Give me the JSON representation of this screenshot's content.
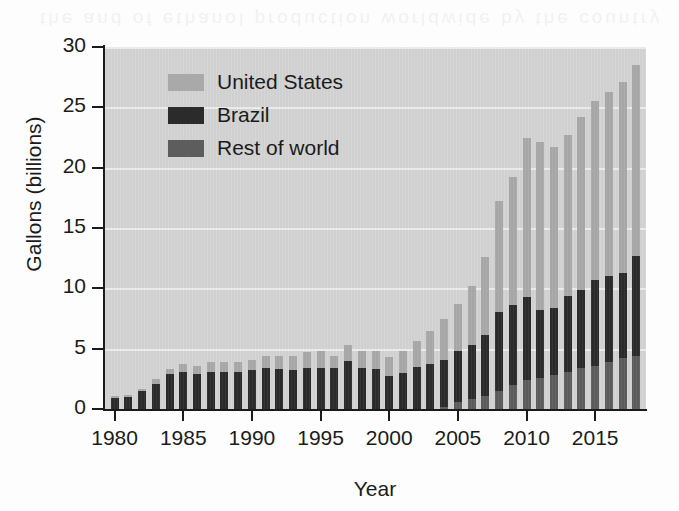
{
  "bleed_text": "the and of ethanol production worldwide by the country",
  "chart_data": {
    "type": "bar",
    "subtype": "stacked-bar",
    "title": "",
    "xlabel": "Year",
    "ylabel": "Gallons (billions)",
    "ylim": [
      0,
      30
    ],
    "yticks": [
      0,
      5,
      10,
      15,
      20,
      25,
      30
    ],
    "ytick_labels": [
      "0",
      "5",
      "10",
      "15",
      "20",
      "25",
      "30"
    ],
    "xticks": [
      1980,
      1985,
      1990,
      1995,
      2000,
      2005,
      2010,
      2015
    ],
    "xtick_labels": [
      "1980",
      "1985",
      "1990",
      "1995",
      "2000",
      "2005",
      "2010",
      "2015"
    ],
    "xlim": [
      1979.3,
      2018.7
    ],
    "grid": "horizontal",
    "legend_position": "top-left-inside",
    "stack_order_bottom_to_top": [
      "Rest of world",
      "Brazil",
      "United States"
    ],
    "categories": [
      1980,
      1981,
      1982,
      1983,
      1984,
      1985,
      1986,
      1987,
      1988,
      1989,
      1990,
      1991,
      1992,
      1993,
      1994,
      1995,
      1996,
      1997,
      1998,
      1999,
      2000,
      2001,
      2002,
      2003,
      2004,
      2005,
      2006,
      2007,
      2008,
      2009,
      2010,
      2011,
      2012,
      2013,
      2014,
      2015,
      2016,
      2017,
      2018
    ],
    "series": [
      {
        "name": "Rest of world",
        "color": "#5d5d5d",
        "values": [
          0.0,
          0.0,
          0.0,
          0.0,
          0.0,
          0.0,
          0.0,
          0.0,
          0.0,
          0.0,
          0.0,
          0.0,
          0.0,
          0.0,
          0.0,
          0.0,
          0.0,
          0.0,
          0.0,
          0.0,
          0.0,
          0.0,
          0.0,
          0.0,
          0.2,
          0.6,
          0.8,
          1.1,
          1.5,
          2.0,
          2.4,
          2.6,
          2.8,
          3.1,
          3.4,
          3.6,
          3.9,
          4.2,
          4.4
        ]
      },
      {
        "name": "Brazil",
        "color": "#2b2b2b",
        "values": [
          0.9,
          1.0,
          1.5,
          2.1,
          2.9,
          3.1,
          2.9,
          3.1,
          3.1,
          3.1,
          3.2,
          3.4,
          3.3,
          3.2,
          3.4,
          3.4,
          3.4,
          4.0,
          3.4,
          3.3,
          2.7,
          3.0,
          3.5,
          3.7,
          3.9,
          4.2,
          4.5,
          5.0,
          6.5,
          6.6,
          6.9,
          5.6,
          5.6,
          6.3,
          6.5,
          7.1,
          7.1,
          7.1,
          8.3
        ]
      },
      {
        "name": "United States",
        "color": "#a9a9a9",
        "values": [
          0.2,
          0.2,
          0.2,
          0.4,
          0.4,
          0.6,
          0.7,
          0.8,
          0.8,
          0.8,
          0.9,
          1.0,
          1.1,
          1.2,
          1.3,
          1.4,
          1.0,
          1.3,
          1.4,
          1.5,
          1.6,
          1.8,
          2.1,
          2.8,
          3.4,
          3.9,
          4.9,
          6.5,
          9.2,
          10.6,
          13.2,
          13.9,
          13.3,
          13.3,
          14.3,
          14.8,
          15.3,
          15.8,
          15.8
        ]
      }
    ],
    "totals": [
      1.1,
      1.2,
      1.7,
      2.5,
      3.5,
      3.7,
      3.6,
      3.9,
      3.9,
      3.9,
      4.1,
      4.4,
      4.4,
      4.4,
      4.7,
      4.8,
      4.4,
      5.3,
      4.8,
      4.8,
      4.3,
      4.8,
      5.6,
      6.5,
      7.5,
      8.7,
      10.2,
      12.6,
      17.2,
      19.2,
      22.5,
      22.1,
      21.7,
      22.7,
      24.2,
      25.5,
      26.3,
      27.1,
      28.5
    ]
  },
  "legend": {
    "items": [
      {
        "label": "United States",
        "color": "#a9a9a9"
      },
      {
        "label": "Brazil",
        "color": "#2b2b2b"
      },
      {
        "label": "Rest of world",
        "color": "#5d5d5d"
      }
    ]
  }
}
